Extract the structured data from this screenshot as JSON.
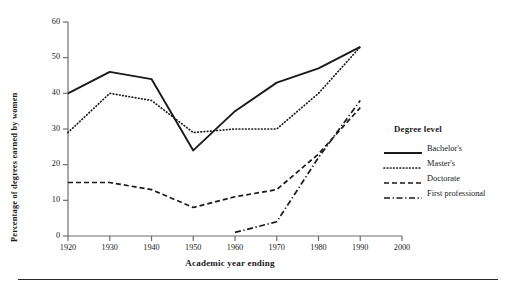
{
  "chart_data": {
    "type": "line",
    "title": "",
    "xlabel": "Academic year ending",
    "ylabel": "Percentage of degrees earned by women",
    "xlim": [
      1920,
      2000
    ],
    "ylim": [
      0,
      60
    ],
    "xticks": [
      1920,
      1930,
      1940,
      1950,
      1960,
      1970,
      1980,
      1990,
      2000
    ],
    "yticks": [
      0,
      10,
      20,
      30,
      40,
      50,
      60
    ],
    "grid": false,
    "legend_position": "right",
    "legend_title": "Degree level",
    "series": [
      {
        "name": "Bachelor's",
        "style": "solid",
        "x": [
          1920,
          1930,
          1940,
          1950,
          1960,
          1970,
          1980,
          1990
        ],
        "values": [
          40,
          46,
          44,
          24,
          35,
          43,
          47,
          53
        ]
      },
      {
        "name": "Master's",
        "style": "dotted",
        "x": [
          1920,
          1930,
          1940,
          1950,
          1960,
          1970,
          1980,
          1990
        ],
        "values": [
          29,
          40,
          38,
          29,
          30,
          30,
          40,
          53
        ]
      },
      {
        "name": "Doctorate",
        "style": "dashed",
        "x": [
          1920,
          1930,
          1940,
          1950,
          1960,
          1970,
          1980,
          1990
        ],
        "values": [
          15,
          15,
          13,
          8,
          11,
          13,
          23,
          36
        ]
      },
      {
        "name": "First professional",
        "style": "dashdot",
        "x": [
          1960,
          1970,
          1980,
          1990
        ],
        "values": [
          1,
          4,
          22,
          38
        ]
      }
    ]
  },
  "axis": {
    "y_title": "Percentage of degrees earned by women",
    "x_title": "Academic year ending",
    "x_tick_labels": [
      "1920",
      "1930",
      "1940",
      "1950",
      "1960",
      "1970",
      "1980",
      "1990",
      "2000"
    ],
    "y_tick_labels": [
      "0",
      "10",
      "20",
      "30",
      "40",
      "50",
      "60"
    ]
  },
  "legend": {
    "title": "Degree level",
    "items": [
      {
        "label": "Bachelor's",
        "style": "solid"
      },
      {
        "label": "Master's",
        "style": "dotted"
      },
      {
        "label": "Doctorate",
        "style": "dashed"
      },
      {
        "label": "First professional",
        "style": "dashdot"
      }
    ]
  },
  "colors": {
    "line": "#1a1a1a",
    "axis": "#6f6f6f",
    "rule": "#2b2b2b",
    "background": "#ffffff"
  }
}
